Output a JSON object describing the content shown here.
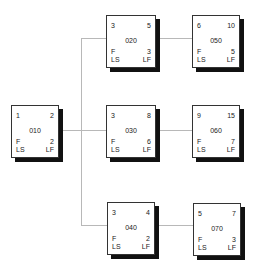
{
  "diagram": {
    "type": "network-activity-on-node",
    "colors": {
      "border": "#333333",
      "shadow": "#111111",
      "connector": "#b8b8b8",
      "text": "#222222"
    },
    "nodes": {
      "n010": {
        "id": "010",
        "es": "1",
        "ef": "2",
        "f": "F",
        "ls": "LS",
        "slack": "2",
        "lf": "LF"
      },
      "n020": {
        "id": "020",
        "es": "3",
        "ef": "5",
        "f": "F",
        "ls": "LS",
        "slack": "3",
        "lf": "LF"
      },
      "n030": {
        "id": "030",
        "es": "3",
        "ef": "8",
        "f": "F",
        "ls": "LS",
        "slack": "6",
        "lf": "LF"
      },
      "n040": {
        "id": "040",
        "es": "3",
        "ef": "4",
        "f": "F",
        "ls": "LS",
        "slack": "2",
        "lf": "LF"
      },
      "n050": {
        "id": "050",
        "es": "6",
        "ef": "10",
        "f": "F",
        "ls": "LS",
        "slack": "5",
        "lf": "LF"
      },
      "n060": {
        "id": "060",
        "es": "9",
        "ef": "15",
        "f": "F",
        "ls": "LS",
        "slack": "7",
        "lf": "LF"
      },
      "n070": {
        "id": "070",
        "es": "5",
        "ef": "7",
        "f": "F",
        "ls": "LS",
        "slack": "3",
        "lf": "LF"
      }
    },
    "edges": [
      {
        "from": "010",
        "to": "020"
      },
      {
        "from": "010",
        "to": "030"
      },
      {
        "from": "010",
        "to": "040"
      },
      {
        "from": "020",
        "to": "050"
      },
      {
        "from": "030",
        "to": "060"
      },
      {
        "from": "040",
        "to": "070"
      }
    ]
  }
}
